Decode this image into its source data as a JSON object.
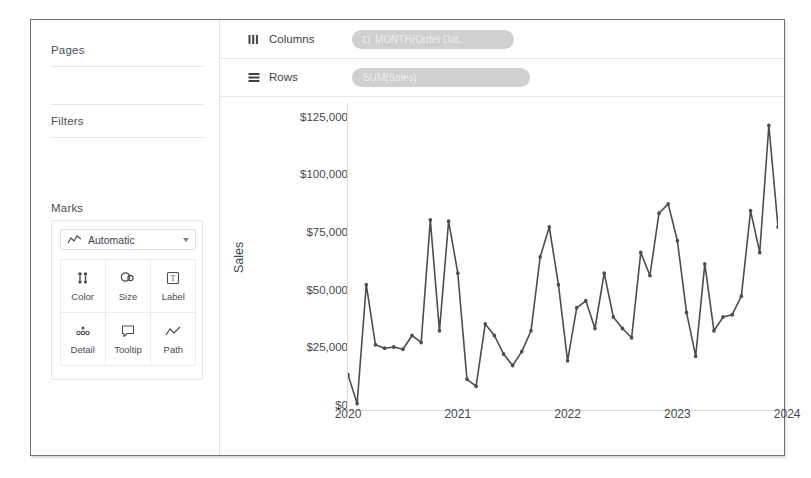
{
  "sidebar": {
    "pages_label": "Pages",
    "filters_label": "Filters",
    "marks_label": "Marks",
    "mark_type": "Automatic",
    "mark_type_icon": "line-chart-icon",
    "buttons": [
      {
        "label": "Color",
        "icon": "color-icon"
      },
      {
        "label": "Size",
        "icon": "size-icon"
      },
      {
        "label": "Label",
        "icon": "label-icon"
      },
      {
        "label": "Detail",
        "icon": "detail-icon"
      },
      {
        "label": "Tooltip",
        "icon": "tooltip-icon"
      },
      {
        "label": "Path",
        "icon": "path-icon"
      }
    ]
  },
  "shelves": {
    "columns_label": "Columns",
    "columns_icon": "columns-icon",
    "columns_pill": "MONTH(Order Dat..",
    "rows_label": "Rows",
    "rows_icon": "rows-icon",
    "rows_pill": "SUM(Sales)"
  },
  "chart_data": {
    "type": "line",
    "title": "",
    "xlabel": "",
    "ylabel": "Sales",
    "x_tick_labels": [
      "2020",
      "2021",
      "2022",
      "2023",
      "2024"
    ],
    "y_tick_labels": [
      "$0",
      "$25,000",
      "$50,000",
      "$75,000",
      "$100,000",
      "$125,000"
    ],
    "ylim": [
      0,
      130000
    ],
    "y_ticks": [
      0,
      25000,
      50000,
      75000,
      100000,
      125000
    ],
    "grid": false,
    "legend": "none",
    "series": [
      {
        "name": "SUM(Sales)",
        "values": [
          14000,
          1500,
          53000,
          27000,
          25500,
          26000,
          25000,
          31000,
          28000,
          81000,
          33000,
          80500,
          58000,
          12000,
          9000,
          36000,
          31000,
          23000,
          18000,
          24000,
          33000,
          65000,
          78000,
          53000,
          20000,
          43000,
          46000,
          34000,
          58000,
          39000,
          34000,
          30000,
          67000,
          57000,
          84000,
          88000,
          72000,
          41000,
          22000,
          62000,
          33000,
          39000,
          40000,
          48000,
          85000,
          67000,
          122000,
          78000
        ]
      }
    ]
  },
  "colors": {
    "line": "#4a4d53",
    "frame_border": "#6f7278",
    "pill": "#cfd0d2",
    "text": "#45484d"
  }
}
